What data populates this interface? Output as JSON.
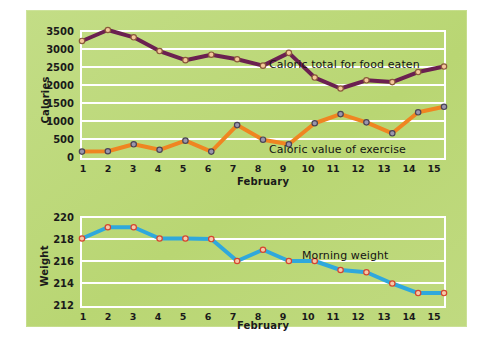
{
  "figure": {
    "background_color": "#ffffff",
    "panel_color": "#bcd97a"
  },
  "chart_data": [
    {
      "type": "line",
      "id": "calories-chart",
      "title": "",
      "xlabel": "February",
      "ylabel": "Calories",
      "x": [
        1,
        2,
        3,
        4,
        5,
        6,
        7,
        8,
        9,
        10,
        11,
        12,
        13,
        14,
        15
      ],
      "xtick_labels": [
        "1",
        "2",
        "3",
        "4",
        "5",
        "6",
        "7",
        "8",
        "9",
        "10",
        "11",
        "12",
        "13",
        "14",
        "15"
      ],
      "ytick_labels": [
        "0",
        "500",
        "1000",
        "1500",
        "2000",
        "2500",
        "3000",
        "3500"
      ],
      "yticks": [
        0,
        500,
        1000,
        1500,
        2000,
        2500,
        3000,
        3500
      ],
      "ylim": [
        0,
        3500
      ],
      "grid": true,
      "legend_position": "inline-annotation",
      "series": [
        {
          "name": "Caloric total for food eaten",
          "color": "#6b2050",
          "marker_fill": "#f4c79a",
          "marker_edge": "#8a5a3a",
          "values": [
            3200,
            3500,
            3300,
            2925,
            2675,
            2825,
            2700,
            2525,
            2875,
            2200,
            1900,
            2125,
            2075,
            2350,
            2500
          ]
        },
        {
          "name": "Caloric value of exercise",
          "color": "#ef8521",
          "marker_fill": "#9a96ad",
          "marker_edge": "#4a4455",
          "values": [
            175,
            185,
            375,
            225,
            475,
            175,
            900,
            500,
            375,
            950,
            1200,
            975,
            675,
            1250,
            1400
          ]
        }
      ],
      "annotations": [
        {
          "text": "Caloric total for food eaten",
          "x": 10.0,
          "y": 2600
        },
        {
          "text": "Caloric value of exercise",
          "x": 9.7,
          "y": 390
        }
      ]
    },
    {
      "type": "line",
      "id": "weight-chart",
      "title": "",
      "xlabel": "February",
      "ylabel": "Weight",
      "x": [
        1,
        2,
        3,
        4,
        5,
        6,
        7,
        8,
        9,
        10,
        11,
        12,
        13,
        14,
        15
      ],
      "xtick_labels": [
        "1",
        "2",
        "3",
        "4",
        "5",
        "6",
        "7",
        "8",
        "9",
        "10",
        "11",
        "12",
        "13",
        "14",
        "15"
      ],
      "ytick_labels": [
        "212",
        "214",
        "216",
        "218",
        "220"
      ],
      "yticks": [
        212,
        214,
        216,
        218,
        220
      ],
      "ylim": [
        212,
        220
      ],
      "grid": true,
      "legend_position": "inline-annotation",
      "series": [
        {
          "name": "Morning weight",
          "color": "#2fa8dc",
          "marker_fill": "#f6c9a8",
          "marker_edge": "#d4452f",
          "values": [
            218.0,
            219.0,
            219.0,
            218.0,
            218.0,
            217.95,
            216.0,
            217.0,
            216.0,
            216.0,
            215.2,
            215.0,
            214.0,
            213.15,
            213.15
          ]
        }
      ],
      "annotations": [
        {
          "text": "Morning weight",
          "x": 10.2,
          "y": 216.6
        }
      ]
    }
  ]
}
